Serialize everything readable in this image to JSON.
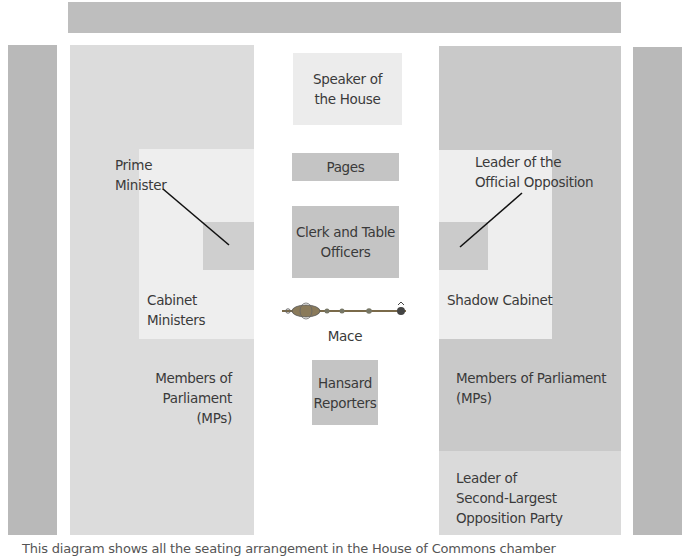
{
  "diagram": {
    "colors": {
      "top_bar": "#bebebe",
      "pillars": "#b9b9b9",
      "government_side": "#dcdcdc",
      "opposition_side": "#c9c9c9",
      "cabinet_area": "#eeeeee",
      "leader_seat": "#cbcbcb",
      "speaker": "#ececec",
      "table_boxes": "#c4c4c4",
      "second_party_area": "#dadada"
    },
    "center": {
      "speaker": "Speaker of\nthe House",
      "speaker_lines": [
        "Speaker of",
        "the House"
      ],
      "pages": "Pages",
      "clerk_lines": [
        "Clerk and Table",
        "Officers"
      ],
      "mace": "Mace",
      "hansard_lines": [
        "Hansard",
        "Reporters"
      ]
    },
    "government": {
      "prime_minister_lines": [
        "Prime",
        "Minister"
      ],
      "cabinet_lines": [
        "Cabinet",
        "Ministers"
      ],
      "mps_lines": [
        "Members of Parliament",
        "(MPs)"
      ]
    },
    "opposition": {
      "leader_lines": [
        "Leader of the",
        "Official Opposition"
      ],
      "shadow_cabinet": "Shadow Cabinet",
      "mps_lines": [
        "Members of Parliament",
        "(MPs)"
      ],
      "second_party_lines": [
        "Leader of",
        "Second-Largest",
        "Opposition Party"
      ]
    },
    "caption": "This diagram shows all the seating arrangement in the House of Commons chamber"
  }
}
